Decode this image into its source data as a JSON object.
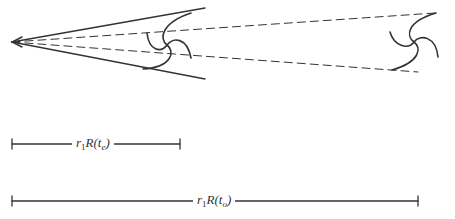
{
  "diagram": {
    "type": "cosmology-expansion-illustration",
    "colors": {
      "ink": "#333333",
      "background": "#ffffff"
    },
    "observer": {
      "name": "observer-point",
      "x": 12,
      "y": 42
    },
    "galaxies": [
      {
        "name": "galaxy-emission",
        "label": "galaxy at t_e",
        "cx": 166,
        "cy": 45
      },
      {
        "name": "galaxy-observed",
        "label": "galaxy at t_o",
        "cx": 412,
        "cy": 42
      }
    ],
    "scale_bars": [
      {
        "name": "distance-emission",
        "x1": 12,
        "x2": 180,
        "y": 144,
        "label_r": "r",
        "label_sub": "1",
        "label_R": "R(t",
        "label_t": "e",
        "label_close": ")"
      },
      {
        "name": "distance-observed",
        "x1": 12,
        "x2": 418,
        "y": 201,
        "label_r": "r",
        "label_sub": "1",
        "label_R": "R(t",
        "label_t": "o",
        "label_close": ")"
      }
    ]
  }
}
